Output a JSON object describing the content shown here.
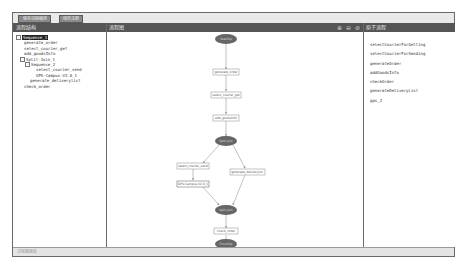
{
  "toolbar": {
    "buttons": [
      {
        "label": "保存流程编排"
      },
      {
        "label": "组件注册"
      }
    ]
  },
  "headers": {
    "left": "流程结构",
    "center": "流程图",
    "right": "原子流程",
    "zoom_icons": [
      "zoom-in-icon",
      "zoom-out-icon",
      "zoom-reset-icon"
    ]
  },
  "tree": {
    "items": [
      {
        "label": "Sequence_1",
        "depth": 0,
        "toggle": "-",
        "selected": true
      },
      {
        "label": "generate_order",
        "depth": 1
      },
      {
        "label": "select_courier_get",
        "depth": 1
      },
      {
        "label": "add_goodsInfo",
        "depth": 1
      },
      {
        "label": "Split-Join_1",
        "depth": 1,
        "toggle": "-"
      },
      {
        "label": "Sequence_2",
        "depth": 2,
        "toggle": "-"
      },
      {
        "label": "select_courier_send",
        "depth": 3
      },
      {
        "label": "GPS-Campus-V2.0_1",
        "depth": 3
      },
      {
        "label": "generate_deliverylist",
        "depth": 2
      },
      {
        "label": "check_order",
        "depth": 1
      }
    ]
  },
  "flow": {
    "nodes": {
      "start": "StartOp",
      "n1": "generate_order",
      "n2": "select_courier_get",
      "n3": "add_goodsInfo",
      "split": "Split-Join",
      "n4": "select_courier_send",
      "n5": "GPS-Campus-V2.0_1",
      "n6": "generate_deliverylist",
      "join": "Split-Join",
      "n7": "check_order",
      "end": "FinishOp"
    }
  },
  "atomic": {
    "items": [
      "selectCourierForGetting",
      "selectCourierForSending",
      "generateOrder",
      "addGoodsInfo",
      "checkOrder",
      "generateDeliveryList",
      "gps_2"
    ]
  },
  "status": {
    "text": "流程图面板"
  },
  "colors": {
    "header_bg": "#555555",
    "oval_fill": "#666666",
    "box_border": "#888888",
    "edge": "#999999"
  }
}
